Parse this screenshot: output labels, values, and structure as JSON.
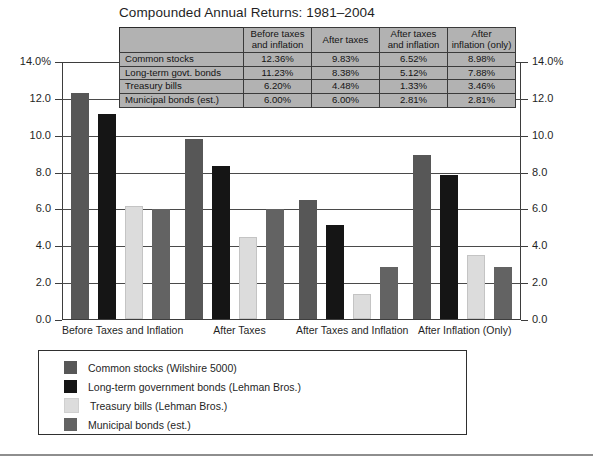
{
  "chart_data": {
    "type": "bar",
    "title": "Compounded Annual Returns: 1981–2004",
    "xlabel": "",
    "ylabel": "",
    "ylim": [
      0,
      14
    ],
    "yticks": [
      "0.0",
      "2.0",
      "4.0",
      "6.0",
      "8.0",
      "10.0",
      "12.0",
      "14.0%"
    ],
    "ytick_values": [
      0,
      2,
      4,
      6,
      8,
      10,
      12,
      14
    ],
    "grid": true,
    "legend_position": "bottom",
    "dual_axis": true,
    "categories": [
      "Before Taxes and Inflation",
      "After Taxes",
      "After Taxes and Inflation",
      "After Inflation (Only)"
    ],
    "series": [
      {
        "name": "Common stocks (Wilshire 5000)",
        "short_name": "Common stocks",
        "color": "#575757",
        "values": [
          12.36,
          9.83,
          6.52,
          8.98
        ],
        "labels": [
          "12.36%",
          "9.83%",
          "6.52%",
          "8.98%"
        ]
      },
      {
        "name": "Long-term government bonds (Lehman Bros.)",
        "short_name": "Long-term govt. bonds",
        "color": "#151515",
        "values": [
          11.23,
          8.38,
          5.12,
          7.88
        ],
        "labels": [
          "11.23%",
          "8.38%",
          "5.12%",
          "7.88%"
        ]
      },
      {
        "name": "Treasury bills (Lehman Bros.)",
        "short_name": "Treasury bills",
        "color": "#dcdcdc",
        "values": [
          6.2,
          4.48,
          1.33,
          3.46
        ],
        "labels": [
          "6.20%",
          "4.48%",
          "1.33%",
          "3.46%"
        ]
      },
      {
        "name": "Municipal bonds (est.)",
        "short_name": "Municipal bonds (est.)",
        "color": "#636363",
        "values": [
          6.0,
          6.0,
          2.81,
          2.81
        ],
        "labels": [
          "6.00%",
          "6.00%",
          "2.81%",
          "2.81%"
        ]
      }
    ]
  },
  "table": {
    "corner_label": "",
    "columns": [
      "Before taxes and inflation",
      "After taxes",
      "After taxes and inflation",
      "After inflation (only)"
    ],
    "column_lines": [
      [
        "Before taxes",
        "and inflation"
      ],
      [
        "After taxes",
        ""
      ],
      [
        "After taxes",
        "and inflation"
      ],
      [
        "After",
        "inflation (only)"
      ]
    ],
    "rows": [
      {
        "label": "Common stocks",
        "values": [
          "12.36%",
          "9.83%",
          "6.52%",
          "8.98%"
        ]
      },
      {
        "label": "Long-term govt. bonds",
        "values": [
          "11.23%",
          "8.38%",
          "5.12%",
          "7.88%"
        ]
      },
      {
        "label": "Treasury bills",
        "values": [
          "6.20%",
          "4.48%",
          "1.33%",
          "3.46%"
        ]
      },
      {
        "label": "Municipal bonds (est.)",
        "values": [
          "6.00%",
          "6.00%",
          "2.81%",
          "2.81%"
        ]
      }
    ]
  },
  "axis": {
    "left_labels": [
      "14.0%",
      "12.0",
      "10.0",
      "8.0",
      "6.0",
      "4.0",
      "2.0",
      "0.0"
    ],
    "right_labels": [
      "14.0%",
      "12.0",
      "10.0",
      "8.0",
      "6.0",
      "4.0",
      "2.0",
      "0.0"
    ]
  },
  "colors": {
    "common_stocks": "#575757",
    "govt_bonds": "#151515",
    "treasury_bills": "#dcdcdc",
    "municipal_bonds": "#636363",
    "table_background": "#b2b2b2",
    "frame": "#3d3d3d"
  }
}
